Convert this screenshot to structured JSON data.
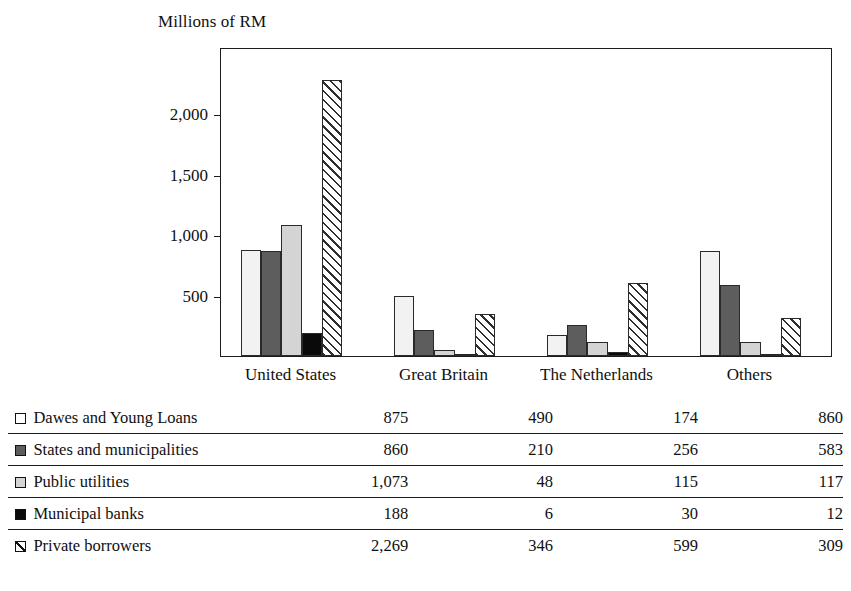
{
  "chart_data": {
    "type": "bar",
    "title": "",
    "ylabel": "Millions of RM",
    "xlabel": "",
    "ylim": [
      0,
      2540
    ],
    "yticks": [
      500,
      1000,
      1500,
      2000
    ],
    "ytick_labels": [
      "500",
      "1,000",
      "1,500",
      "2,000"
    ],
    "grid": false,
    "legend_position": "below-as-table",
    "categories": [
      "United States",
      "Great Britain",
      "The Netherlands",
      "Others"
    ],
    "series": [
      {
        "name": "Dawes and Young Loans",
        "fill": "white",
        "swatch": "square-outline",
        "values": [
          875,
          490,
          174,
          860
        ],
        "value_labels": [
          "875",
          "490",
          "174",
          "860"
        ]
      },
      {
        "name": "States and municipalities",
        "fill": "dark-gray",
        "swatch": "square-dark-gray",
        "values": [
          860,
          210,
          256,
          583
        ],
        "value_labels": [
          "860",
          "210",
          "256",
          "583"
        ]
      },
      {
        "name": "Public utilities",
        "fill": "light-gray",
        "swatch": "square-light-gray",
        "values": [
          1073,
          48,
          115,
          117
        ],
        "value_labels": [
          "1,073",
          "48",
          "115",
          "117"
        ]
      },
      {
        "name": "Municipal banks",
        "fill": "black",
        "swatch": "square-black",
        "values": [
          188,
          6,
          30,
          12
        ],
        "value_labels": [
          "188",
          "6",
          "30",
          "12"
        ]
      },
      {
        "name": "Private borrowers",
        "fill": "diagonal-hatch",
        "swatch": "square-hatched",
        "values": [
          2269,
          346,
          599,
          309
        ],
        "value_labels": [
          "2,269",
          "346",
          "599",
          "309"
        ]
      }
    ]
  },
  "colors": {
    "axis": "#1c1c1c",
    "text": "#101010",
    "series_white": "#f2f2f2",
    "series_dark_gray": "#5d5d5d",
    "series_light_gray": "#d4d4d4",
    "series_black": "#0a0a0a",
    "series_hatch": "#2e2e2e"
  }
}
